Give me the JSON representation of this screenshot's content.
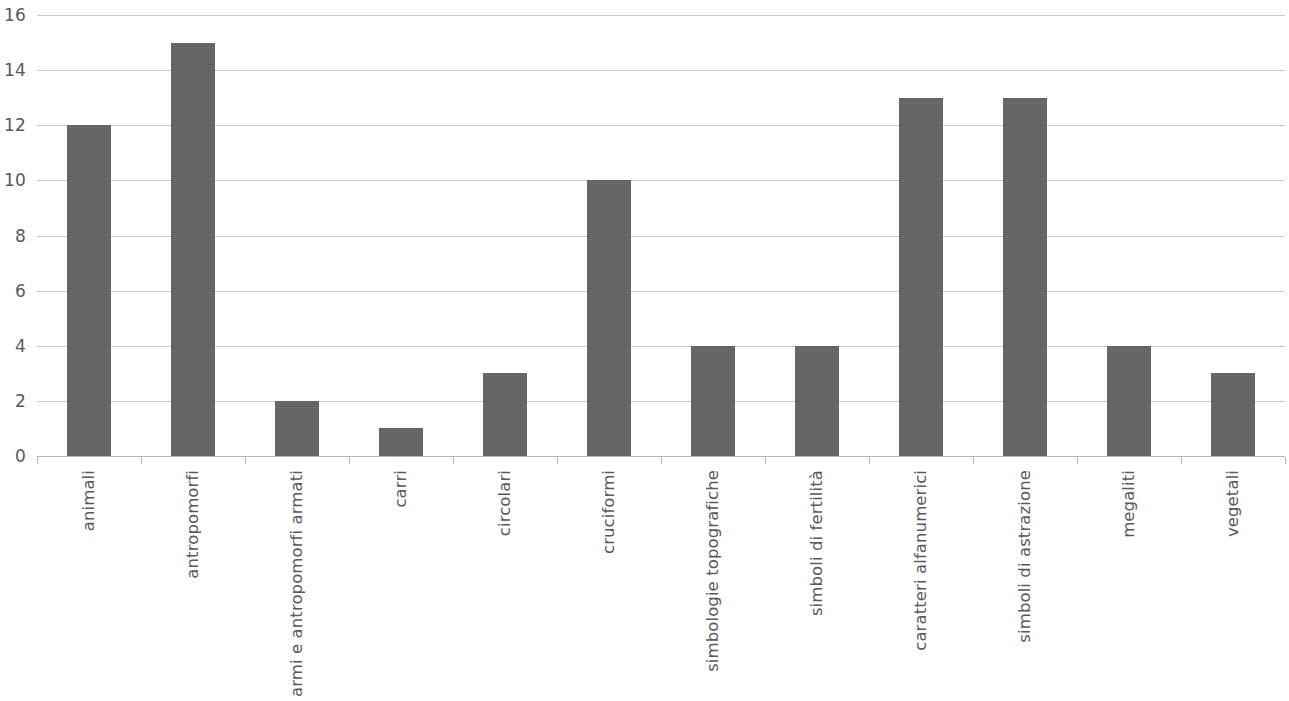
{
  "chart_data": {
    "type": "bar",
    "title": "",
    "subtitle": "",
    "xlabel": "",
    "ylabel": "",
    "ylim": [
      0,
      16
    ],
    "y_ticks": [
      0,
      2,
      4,
      6,
      8,
      10,
      12,
      14,
      16
    ],
    "grid": true,
    "legend": false,
    "legend_position": "none",
    "bar_color": "#646464",
    "gridline_color": "#c9c9c9",
    "axis_color": "#b4b4b4",
    "tick_label_color": "#5a5a5a",
    "x_tick_label_rotation": -90,
    "categories": [
      "animali",
      "antropomorfi",
      "armi e antropomorfi armati",
      "carri",
      "circolari",
      "cruciformi",
      "simbologie topografiche",
      "simboli di fertilità",
      "caratteri alfanumerici",
      "simboli di astrazione",
      "megaliti",
      "vegetali"
    ],
    "values": [
      12,
      15,
      2,
      1,
      3,
      10,
      4,
      4,
      13,
      13,
      4,
      3
    ],
    "series": [
      {
        "name": "",
        "values": [
          12,
          15,
          2,
          1,
          3,
          10,
          4,
          4,
          13,
          13,
          4,
          3
        ]
      }
    ]
  },
  "y_axis": {
    "labels": [
      "16",
      "14",
      "12",
      "10",
      "8",
      "6",
      "4",
      "2",
      "0"
    ]
  }
}
